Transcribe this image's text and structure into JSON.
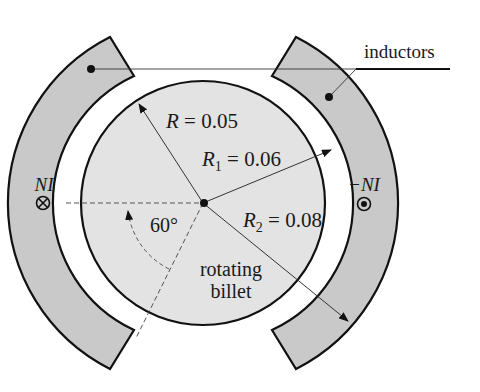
{
  "diagram": {
    "type": "induction-heating-cross-section",
    "center": {
      "x": 203,
      "y": 203
    },
    "colors": {
      "background": "#ffffff",
      "inductor_fill": "#c9c9c9",
      "billet_fill": "#e3e3e3",
      "stroke": "#111111",
      "leader_line": "#333333"
    },
    "labels": {
      "inductors": "inductors",
      "R": "R",
      "R_value": " = 0.05",
      "R1": "R",
      "R1_sub": "1",
      "R1_value": " = 0.06",
      "R2": "R",
      "R2_sub": "2",
      "R2_value": " = 0.08",
      "angle": "60°",
      "left_current": "NI",
      "right_current": "−NI",
      "billet_line1": "rotating",
      "billet_line2": "billet"
    },
    "symbols": {
      "left_current_symbol": "current-into-page-icon",
      "right_current_symbol": "current-out-of-page-icon"
    },
    "dimensions": {
      "billet_radius": "R = 0.05",
      "inductor_inner_radius": "R1 = 0.06",
      "inductor_outer_radius": "R2 = 0.08",
      "inductor_angle_deg": 60
    }
  }
}
